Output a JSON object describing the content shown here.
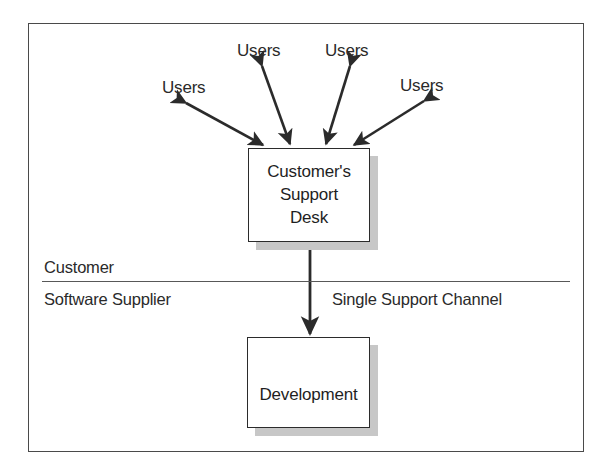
{
  "diagram": {
    "frame": {
      "name": "outer-frame"
    },
    "zones": {
      "upper_label": "Customer",
      "lower_label": "Software Supplier",
      "channel_label": "Single Support Channel"
    },
    "nodes": [
      {
        "id": "support-desk",
        "text": "Customer's\nSupport\nDesk",
        "x": 248,
        "y": 148,
        "width": 122,
        "height": 94
      },
      {
        "id": "development",
        "text": "Development",
        "x": 247,
        "y": 337,
        "width": 123,
        "height": 91
      }
    ],
    "users": [
      {
        "id": "users-left",
        "label": "Users",
        "x": 162,
        "y": 78
      },
      {
        "id": "users-top-left",
        "label": "Users",
        "x": 237,
        "y": 41
      },
      {
        "id": "users-top-right",
        "label": "Users",
        "x": 325,
        "y": 41
      },
      {
        "id": "users-right",
        "label": "Users",
        "x": 400,
        "y": 76
      }
    ],
    "connectors": [
      {
        "id": "users-left-arrow",
        "kind": "double-arrow"
      },
      {
        "id": "users-top-left-arrow",
        "kind": "double-arrow"
      },
      {
        "id": "users-top-right-arrow",
        "kind": "double-arrow"
      },
      {
        "id": "users-right-arrow",
        "kind": "double-arrow"
      },
      {
        "id": "support-channel-arrow",
        "kind": "double-arrow"
      }
    ],
    "colors": {
      "line": "#2b2b2b",
      "frame": "#4a4a4a",
      "shadow": "#c7c7c7",
      "text": "#1f1f1f",
      "background": "#ffffff"
    }
  }
}
